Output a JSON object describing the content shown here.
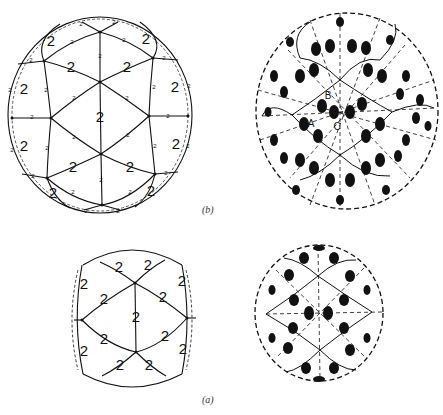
{
  "figure": {
    "panels": [
      {
        "id": "b",
        "caption": "(b)",
        "left_diagram": {
          "description": "Sphere with graph of great-circle arcs, each edge labeled with twofold axis order",
          "edge_label": "2",
          "face_label": "2"
        },
        "right_diagram": {
          "description": "Sphere tiled with comma-shaped motifs (black dot with tail), dashed lines show symmetry axes",
          "point_labels": [
            "A",
            "B",
            "C"
          ]
        }
      },
      {
        "id": "a",
        "caption": "(a)",
        "left_diagram": {
          "description": "Ellipsoidal sphere with graph edges labeled 2",
          "edge_label": "2"
        },
        "right_diagram": {
          "description": "Sphere tiled with comma-shaped motifs and dashed symmetry lines"
        }
      }
    ],
    "colors": {
      "ink": "#111111",
      "background": "#ffffff"
    }
  }
}
